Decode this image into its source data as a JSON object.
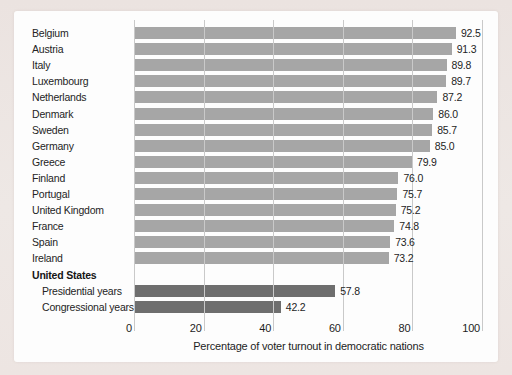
{
  "page": {
    "background_color": "#ebe3e0",
    "panel_color": "#fdfdfd"
  },
  "chart_data": {
    "type": "bar",
    "orientation": "horizontal",
    "title": "",
    "xlabel": "Percentage of voter turnout in democratic nations",
    "ylabel": "",
    "xlim": [
      0,
      100
    ],
    "xticks": [
      "0",
      "20",
      "40",
      "60",
      "80",
      "100"
    ],
    "grid": "vertical",
    "legend": "none",
    "colors": {
      "bar_default": "#a6a6a6",
      "bar_united_states": "#6e6e6e",
      "gridline": "#c9c9c9",
      "text": "#242424"
    },
    "rows": [
      {
        "label": "Belgium",
        "value": 92.5,
        "value_label": "92.5"
      },
      {
        "label": "Austria",
        "value": 91.3,
        "value_label": "91.3"
      },
      {
        "label": "Italy",
        "value": 89.8,
        "value_label": "89.8"
      },
      {
        "label": "Luxembourg",
        "value": 89.7,
        "value_label": "89.7"
      },
      {
        "label": "Netherlands",
        "value": 87.2,
        "value_label": "87.2"
      },
      {
        "label": "Denmark",
        "value": 86.0,
        "value_label": "86.0"
      },
      {
        "label": "Sweden",
        "value": 85.7,
        "value_label": "85.7"
      },
      {
        "label": "Germany",
        "value": 85.0,
        "value_label": "85.0"
      },
      {
        "label": "Greece",
        "value": 79.9,
        "value_label": "79.9"
      },
      {
        "label": "Finland",
        "value": 76.0,
        "value_label": "76.0"
      },
      {
        "label": "Portugal",
        "value": 75.7,
        "value_label": "75.7"
      },
      {
        "label": "United Kingdom",
        "value": 75.2,
        "value_label": "75.2"
      },
      {
        "label": "France",
        "value": 74.8,
        "value_label": "74.8"
      },
      {
        "label": "Spain",
        "value": 73.6,
        "value_label": "73.6"
      },
      {
        "label": "Ireland",
        "value": 73.2,
        "value_label": "73.2"
      },
      {
        "label": "United States",
        "header": true
      },
      {
        "label": "Presidential years",
        "value": 57.8,
        "value_label": "57.8",
        "indent": true,
        "us": true
      },
      {
        "label": "Congressional years",
        "value": 42.2,
        "value_label": "42.2",
        "indent": true,
        "us": true
      }
    ]
  }
}
